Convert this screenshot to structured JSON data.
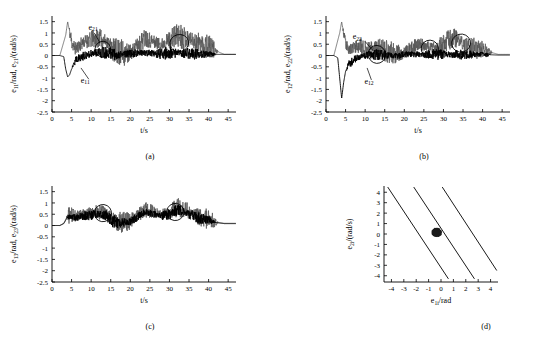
{
  "figure": {
    "panels": [
      {
        "id": "a",
        "caption": "(a)",
        "ylabel": "e11/rad, e21/(rad/s)",
        "ylabel_parts": [
          "e",
          "11",
          "/rad, ",
          "e",
          "21",
          "/(rad/s)"
        ],
        "xlabel": "t/s",
        "yticks": [
          "1.5",
          "1",
          "0.5",
          "0",
          "-0.5",
          "-1",
          "-1.5",
          "-2",
          "-2.5"
        ],
        "ytick_values": [
          1.5,
          1,
          0.5,
          0,
          -0.5,
          -1,
          -1.5,
          -2,
          -2.5
        ],
        "xticks": [
          "0",
          "5",
          "10",
          "15",
          "20",
          "25",
          "30",
          "35",
          "40",
          "45"
        ],
        "xtick_values": [
          0,
          5,
          10,
          15,
          20,
          25,
          30,
          35,
          40,
          45
        ],
        "xlim": [
          0,
          47
        ],
        "ylim": [
          -2.5,
          1.75
        ],
        "annotations": [
          {
            "text": "e21",
            "base": "e",
            "sub": "21",
            "x": 10.5,
            "y": 1.15
          },
          {
            "text": "e11",
            "base": "e",
            "sub": "11",
            "x": 8.5,
            "y": -1.2
          }
        ],
        "ellipses": [
          {
            "cx": 13.0,
            "cy": 0.28,
            "rx": 2.0,
            "ry": 0.35,
            "rot": -20
          },
          {
            "cx": 32.5,
            "cy": 0.55,
            "rx": 2.4,
            "ry": 0.38,
            "rot": -15
          }
        ],
        "leaders": [
          {
            "x1": 10.8,
            "y1": 1.0,
            "x2": 12.3,
            "y2": 0.55
          },
          {
            "x1": 9.4,
            "y1": -1.05,
            "x2": 7.4,
            "y2": -0.55
          }
        ]
      },
      {
        "id": "b",
        "caption": "(b)",
        "ylabel": "e12/rad, e22/(rad/s)",
        "ylabel_parts": [
          "e",
          "12",
          "/rad, ",
          "e",
          "22",
          "/(rad/s)"
        ],
        "xlabel": "t/s",
        "yticks": [
          "1.5",
          "1",
          "0.5",
          "0",
          "-0.5",
          "-1",
          "-1.5",
          "-2",
          "-2.5"
        ],
        "ytick_values": [
          1.5,
          1,
          0.5,
          0,
          -0.5,
          -1,
          -1.5,
          -2,
          -2.5
        ],
        "xticks": [
          "0",
          "5",
          "10",
          "15",
          "20",
          "25",
          "30",
          "35",
          "40",
          "45"
        ],
        "xtick_values": [
          0,
          5,
          10,
          15,
          20,
          25,
          30,
          35,
          40,
          45
        ],
        "xlim": [
          0,
          47
        ],
        "ylim": [
          -2.5,
          1.75
        ],
        "annotations": [
          {
            "text": "e22",
            "base": "e",
            "sub": "22",
            "x": 8.0,
            "y": 0.72
          },
          {
            "text": "e12",
            "base": "e",
            "sub": "12",
            "x": 11.0,
            "y": -1.25
          }
        ],
        "ellipses": [
          {
            "cx": 13.0,
            "cy": 0.05,
            "rx": 2.2,
            "ry": 0.4,
            "rot": -20
          },
          {
            "cx": 26.5,
            "cy": 0.3,
            "rx": 2.2,
            "ry": 0.38,
            "rot": -20
          },
          {
            "cx": 34.5,
            "cy": 0.55,
            "rx": 2.4,
            "ry": 0.4,
            "rot": -15
          }
        ],
        "leaders": [
          {
            "x1": 10.0,
            "y1": 0.62,
            "x2": 12.0,
            "y2": 0.22
          },
          {
            "x1": 11.6,
            "y1": -1.08,
            "x2": 10.5,
            "y2": -0.55
          }
        ]
      },
      {
        "id": "c",
        "caption": "(c)",
        "ylabel": "e13/rad, e23/(rad/s)",
        "ylabel_parts": [
          "e",
          "13",
          "/rad, ",
          "e",
          "23",
          "/(rad/s)"
        ],
        "xlabel": "t/s",
        "yticks": [
          "1.5",
          "1",
          "0.5",
          "0",
          "-0.5",
          "-1",
          "-1.5",
          "-2",
          "-2.5"
        ],
        "ytick_values": [
          1.5,
          1,
          0.5,
          0,
          -0.5,
          -1,
          -1.5,
          -2,
          -2.5
        ],
        "xticks": [
          "0",
          "5",
          "10",
          "15",
          "20",
          "25",
          "30",
          "35",
          "40",
          "45"
        ],
        "xtick_values": [
          0,
          5,
          10,
          15,
          20,
          25,
          30,
          35,
          40,
          45
        ],
        "xlim": [
          0,
          47
        ],
        "ylim": [
          -2.5,
          1.75
        ],
        "annotations": [],
        "ellipses": [
          {
            "cx": 13.0,
            "cy": 0.55,
            "rx": 2.2,
            "ry": 0.38,
            "rot": -15
          },
          {
            "cx": 31.5,
            "cy": 0.6,
            "rx": 2.2,
            "ry": 0.38,
            "rot": -15
          }
        ],
        "leaders": []
      },
      {
        "id": "d",
        "caption": "(d)",
        "ylabel": "e2i/(rad/s)",
        "ylabel_parts": [
          "e",
          "2i",
          "/(rad/s)"
        ],
        "xlabel": "e1i/rad",
        "xlabel_parts": [
          "e",
          "1i",
          "/rad"
        ],
        "yticks": [
          "4",
          "3",
          "2",
          "1",
          "0",
          "-1",
          "-2",
          "-3",
          "-4"
        ],
        "ytick_values": [
          4,
          3,
          2,
          1,
          0,
          -1,
          -2,
          -3,
          -4
        ],
        "xticks": [
          "-4",
          "-3",
          "-2",
          "-1",
          "0",
          "1",
          "2",
          "3",
          "4"
        ],
        "xtick_values": [
          -4,
          -3,
          -2,
          -1,
          0,
          1,
          2,
          3,
          4
        ],
        "xlim": [
          -4.6,
          4.6
        ],
        "ylim": [
          -4.6,
          4.6
        ],
        "phase_lines": [
          {
            "x1": -4.3,
            "y1": 4.5,
            "x2": 0.6,
            "y2": -4.3
          },
          {
            "x1": -2.2,
            "y1": 4.5,
            "x2": 2.7,
            "y2": -4.3
          },
          {
            "x1": 0.1,
            "y1": 4.5,
            "x2": 4.5,
            "y2": -3.5
          }
        ],
        "cluster": {
          "cx": -0.35,
          "cy": 0.15,
          "rx": 0.42,
          "ry": 0.45
        }
      }
    ]
  },
  "chart_data": {
    "type": "line",
    "title": "",
    "xlabel": "t/s",
    "ylabel": "error signals",
    "series": [
      {
        "name": "e11",
        "panel": "a",
        "color": "#000000",
        "description": "position error, settles near 0 after transient dip to -1",
        "x": [
          0,
          1,
          2,
          3,
          3.5,
          4,
          4.5,
          5,
          5.5,
          6,
          7,
          8,
          9,
          10,
          12,
          14,
          16,
          18,
          20,
          22,
          24,
          26,
          28,
          30,
          32,
          34,
          36,
          38,
          40,
          42,
          44,
          46
        ],
        "y": [
          0,
          0,
          0,
          -0.05,
          -0.6,
          -0.95,
          -0.85,
          -0.6,
          -0.35,
          -0.2,
          -0.1,
          0,
          0.05,
          0.1,
          0.15,
          0.1,
          0.05,
          0.05,
          0.1,
          0.1,
          0.12,
          0.1,
          0.08,
          0.1,
          0.12,
          0.1,
          0.08,
          0.05,
          0.05,
          0.05,
          0.05,
          0.05
        ]
      },
      {
        "name": "e21",
        "panel": "a",
        "color": "#4d4d4d",
        "description": "velocity error, high-frequency oscillation bursts between 5-42 s",
        "x": [
          0,
          2,
          3.5,
          4,
          5,
          6,
          8,
          10,
          12,
          14,
          16,
          18,
          20,
          22,
          24,
          26,
          28,
          30,
          32,
          34,
          36,
          38,
          40,
          42,
          44,
          46
        ],
        "y": [
          0,
          0,
          0.9,
          1.5,
          0.6,
          0.3,
          0.6,
          0.7,
          0.8,
          0.6,
          0.2,
          0.1,
          0.1,
          0.5,
          0.8,
          0.6,
          0.5,
          0.7,
          0.9,
          0.8,
          0.7,
          0.5,
          0.4,
          0.2,
          0.05,
          0.05
        ]
      },
      {
        "name": "e12",
        "panel": "b",
        "color": "#000000",
        "description": "position error, transient dip to -1.9 near 4 s",
        "x": [
          0,
          1,
          2,
          3,
          3.5,
          4,
          4.5,
          5,
          6,
          7,
          8,
          10,
          12,
          14,
          16,
          18,
          20,
          24,
          28,
          32,
          36,
          40,
          44,
          46
        ],
        "y": [
          0,
          0,
          0,
          -0.1,
          -1.0,
          -1.9,
          -1.2,
          -0.7,
          -0.35,
          -0.2,
          -0.1,
          0,
          0.05,
          0.05,
          0,
          0,
          0.05,
          0.05,
          0.05,
          0.05,
          0.05,
          0.05,
          0.02,
          0.02
        ]
      },
      {
        "name": "e22",
        "panel": "b",
        "color": "#4d4d4d",
        "description": "velocity error, spikes to 1.5 near 4 s then bursts of oscillation",
        "x": [
          0,
          2,
          3.5,
          4,
          5,
          6,
          8,
          10,
          12,
          14,
          16,
          18,
          20,
          22,
          24,
          26,
          28,
          30,
          32,
          34,
          36,
          38,
          40,
          42,
          44,
          46
        ],
        "y": [
          0,
          0,
          1.0,
          1.5,
          0.5,
          0.25,
          0.45,
          0.3,
          0.4,
          0.35,
          0.15,
          0.1,
          0.1,
          0.3,
          0.5,
          0.4,
          0.35,
          0.5,
          0.8,
          0.7,
          0.4,
          0.3,
          0.3,
          0.15,
          0.05,
          0.05
        ]
      },
      {
        "name": "e13_e23",
        "panel": "c",
        "color": "#000000",
        "description": "third-link errors, mostly positive oscillation band 0 to 1",
        "x": [
          0,
          2,
          3,
          4,
          5,
          6,
          8,
          10,
          12,
          14,
          16,
          18,
          20,
          22,
          24,
          26,
          28,
          30,
          32,
          34,
          36,
          38,
          40,
          42,
          44,
          46
        ],
        "y": [
          0,
          0,
          0.1,
          0.45,
          0.5,
          0.4,
          0.5,
          0.55,
          0.6,
          0.5,
          0.2,
          0.15,
          0.2,
          0.5,
          0.7,
          0.6,
          0.5,
          0.6,
          0.8,
          0.7,
          0.5,
          0.35,
          0.3,
          0.15,
          0.1,
          0.1
        ]
      },
      {
        "name": "sliding-surface-lines",
        "panel": "d",
        "color": "#000000",
        "description": "three parallel sliding-mode lines in the e1i-e2i phase plane with error trajectory cluster near origin"
      }
    ],
    "grid": false,
    "legend": "inline annotations"
  }
}
